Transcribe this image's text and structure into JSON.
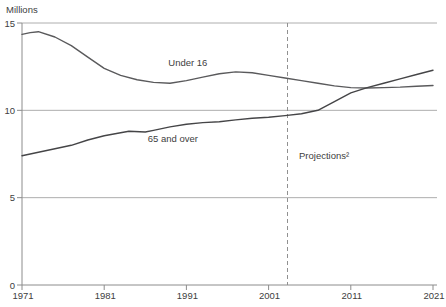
{
  "chart_data": {
    "type": "line",
    "title": "",
    "ylabel": "Millions",
    "xlabel": "",
    "xlim": [
      1971,
      2021
    ],
    "ylim": [
      0,
      15
    ],
    "yticks": [
      0,
      5,
      10,
      15
    ],
    "xticks": [
      1971,
      1981,
      1991,
      2001,
      2011,
      2021
    ],
    "grid": "horizontal-only",
    "legend": "inline-labels",
    "projection_divider": {
      "x": 2003.3,
      "label": "Projections²",
      "style": "dashed"
    },
    "series": [
      {
        "name": "Under 16",
        "color": "#5a5a5c",
        "x": [
          1971,
          1972,
          1973,
          1975,
          1977,
          1979,
          1981,
          1983,
          1985,
          1987,
          1989,
          1991,
          1993,
          1995,
          1997,
          1999,
          2001,
          2003,
          2005,
          2007,
          2009,
          2011,
          2013,
          2015,
          2017,
          2019,
          2021
        ],
        "values": [
          14.35,
          14.45,
          14.5,
          14.2,
          13.7,
          13.05,
          12.4,
          12.0,
          11.75,
          11.6,
          11.55,
          11.7,
          11.9,
          12.1,
          12.2,
          12.15,
          12.0,
          11.85,
          11.7,
          11.55,
          11.4,
          11.3,
          11.28,
          11.3,
          11.33,
          11.38,
          11.42
        ]
      },
      {
        "name": "65 and over",
        "color": "#454547",
        "x": [
          1971,
          1973,
          1975,
          1977,
          1979,
          1981,
          1983,
          1984,
          1986,
          1987,
          1989,
          1991,
          1993,
          1995,
          1997,
          1999,
          2001,
          2003,
          2005,
          2007,
          2009,
          2011,
          2013,
          2015,
          2017,
          2019,
          2021
        ],
        "values": [
          7.4,
          7.6,
          7.8,
          8.0,
          8.3,
          8.55,
          8.72,
          8.8,
          8.76,
          8.85,
          9.05,
          9.2,
          9.3,
          9.35,
          9.45,
          9.55,
          9.6,
          9.7,
          9.8,
          10.0,
          10.5,
          11.0,
          11.3,
          11.55,
          11.8,
          12.05,
          12.3
        ]
      }
    ],
    "annotations": [
      {
        "text": "Under 16",
        "x": 1988.8,
        "y": 12.54
      },
      {
        "text": "65 and over",
        "x": 1986.3,
        "y": 8.19
      },
      {
        "text": "Projections²",
        "x": 2004.7,
        "y": 7.21
      }
    ]
  },
  "colors": {
    "background": "#ffffff",
    "grid": "#aeaeae",
    "axis": "#8c8c8c",
    "text": "#404040",
    "projection_line": "#909090"
  }
}
